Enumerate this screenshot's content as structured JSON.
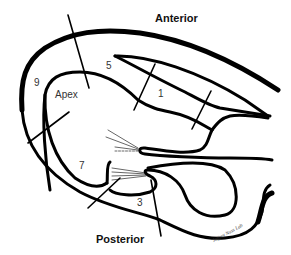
{
  "diagram": {
    "orientation_labels": {
      "anterior": "Anterior",
      "posterior": "Posterior"
    },
    "region_labels": {
      "apex": "Apex",
      "r9": "9",
      "r5": "5",
      "r1": "1",
      "r7": "7",
      "r3": "3"
    },
    "signature": "Jeffrey Nuss Lab",
    "colors": {
      "line": "#000000",
      "background": "#ffffff",
      "text": "#222222"
    }
  }
}
